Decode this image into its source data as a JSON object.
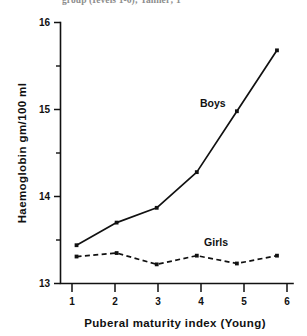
{
  "figure": {
    "caption_fragment": "group (Ievels 1-6); Tanner; 1",
    "background_color": "#ffffff",
    "ink_color": "#111111"
  },
  "chart_data": {
    "type": "line",
    "title": "",
    "xlabel": "Puberal  maturity index (Young)",
    "ylabel": "Haemoglobin  gm/100 ml",
    "x": [
      1,
      2,
      3,
      4,
      5,
      6
    ],
    "xtick_labels": [
      "1",
      "2",
      "3",
      "4",
      "5",
      "6"
    ],
    "ytick_labels": [
      "13",
      "14",
      "15",
      "16"
    ],
    "yticks": [
      13,
      14,
      15,
      16
    ],
    "yminor_ticks": [
      13.5,
      14.5,
      15.5
    ],
    "xlim": [
      0.6,
      6.4
    ],
    "ylim": [
      13,
      16
    ],
    "grid": false,
    "legend_position": "inline-annotations",
    "series": [
      {
        "name": "Boys",
        "style": "solid",
        "marker": "square",
        "label_x": 4.72,
        "label_y": 15.03,
        "values": [
          13.44,
          13.7,
          13.87,
          14.28,
          14.98,
          15.68
        ]
      },
      {
        "name": "Girls",
        "style": "dashed",
        "marker": "square",
        "label_x": 4.78,
        "label_y": 13.43,
        "values": [
          13.31,
          13.35,
          13.22,
          13.32,
          13.23,
          13.32
        ]
      }
    ]
  }
}
